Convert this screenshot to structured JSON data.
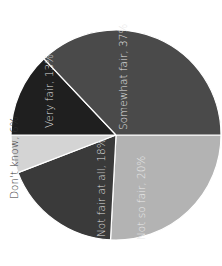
{
  "chart_data": {
    "type": "pie",
    "title": "",
    "orientation": "rotated 90 degrees counter-clockwise",
    "slices": [
      {
        "label": "Somewhat fair",
        "value": 37,
        "display": "Somewhat fair, 37%",
        "color": "#4a4a4a",
        "label_color": "#e6e6e6"
      },
      {
        "label": "Not so fair",
        "value": 20,
        "display": "Not so fair, 20%",
        "color": "#b3b3b3",
        "label_color": "#e9e9e9"
      },
      {
        "label": "Not fair at all",
        "value": 18,
        "display": "Not fair at all, 18%",
        "color": "#3a3a3a",
        "label_color": "#dcdcdc"
      },
      {
        "label": "Don't know",
        "value": 6,
        "display": "Don't know, 6%",
        "color": "#d4d4d4",
        "label_color": "#333333",
        "label_outside": true
      },
      {
        "label": "Very fair",
        "value": 13,
        "display": "Very fair, 13%",
        "color": "#1f1f1f",
        "label_color": "#dddddd"
      }
    ],
    "units": "percent",
    "legend": "none (labels on slices)"
  }
}
